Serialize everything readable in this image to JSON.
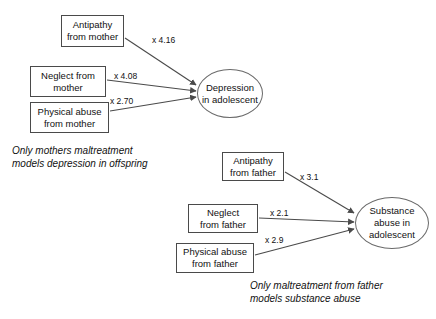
{
  "diagram": {
    "background_color": "#ffffff",
    "line_color": "#4a4a4a",
    "text_color": "#111111",
    "nodes": [
      {
        "id": "antipathy-mother",
        "label": "Antipathy\nfrom mother",
        "shape": "box",
        "x": 61,
        "y": 15,
        "w": 63,
        "h": 32
      },
      {
        "id": "neglect-mother",
        "label": "Neglect from\nmother",
        "shape": "box",
        "x": 30,
        "y": 66,
        "w": 76,
        "h": 31
      },
      {
        "id": "physical-abuse-mother",
        "label": "Physical abuse\nfrom mother",
        "shape": "box",
        "x": 30,
        "y": 102,
        "w": 79,
        "h": 31
      },
      {
        "id": "depression",
        "label": "Depression\nin adolescent",
        "shape": "ellipse",
        "x": 197,
        "y": 69,
        "w": 66,
        "h": 49
      },
      {
        "id": "antipathy-father",
        "label": "Antipathy\nfrom father",
        "shape": "box",
        "x": 222,
        "y": 152,
        "w": 62,
        "h": 29
      },
      {
        "id": "neglect-father",
        "label": "Neglect\nfrom father",
        "shape": "box",
        "x": 188,
        "y": 204,
        "w": 70,
        "h": 29
      },
      {
        "id": "physical-abuse-father",
        "label": "Physical abuse\nfrom father",
        "shape": "box",
        "x": 176,
        "y": 243,
        "w": 78,
        "h": 30
      },
      {
        "id": "substance-abuse",
        "label": "Substance\nabuse in\nadolescent",
        "shape": "ellipse",
        "x": 355,
        "y": 197,
        "w": 74,
        "h": 52
      }
    ],
    "edges": [
      {
        "id": "e1",
        "from": "antipathy-mother",
        "to": "depression",
        "label": "x 4.16",
        "label_x": 152,
        "label_y": 35,
        "x1": 125,
        "y1": 38,
        "x2": 196,
        "y2": 85
      },
      {
        "id": "e2",
        "from": "neglect-mother",
        "to": "depression",
        "label": "x 4.08",
        "label_x": 114,
        "label_y": 71,
        "x1": 107,
        "y1": 80,
        "x2": 196,
        "y2": 91
      },
      {
        "id": "e3",
        "from": "physical-abuse-mother",
        "to": "depression",
        "label": "x 2.70",
        "label_x": 110,
        "label_y": 96,
        "x1": 110,
        "y1": 111,
        "x2": 196,
        "y2": 97
      },
      {
        "id": "e4",
        "from": "antipathy-father",
        "to": "substance-abuse",
        "label": "x 3.1",
        "label_x": 300,
        "label_y": 172,
        "x1": 285,
        "y1": 172,
        "x2": 354,
        "y2": 213
      },
      {
        "id": "e5",
        "from": "neglect-father",
        "to": "substance-abuse",
        "label": "x 2.1",
        "label_x": 270,
        "label_y": 208,
        "x1": 259,
        "y1": 218,
        "x2": 354,
        "y2": 222
      },
      {
        "id": "e6",
        "from": "physical-abuse-father",
        "to": "substance-abuse",
        "label": "x 2.9",
        "label_x": 265,
        "label_y": 235,
        "x1": 255,
        "y1": 255,
        "x2": 354,
        "y2": 229
      }
    ],
    "captions": [
      {
        "id": "caption-mother",
        "text": "Only mothers maltreatment\nmodels depression in offspring",
        "x": 12,
        "y": 144
      },
      {
        "id": "caption-father",
        "text": "Only maltreatment from father\nmodels substance abuse",
        "x": 250,
        "y": 279
      }
    ]
  }
}
